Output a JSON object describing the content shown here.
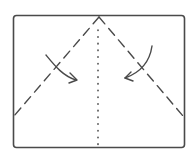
{
  "diagram": {
    "type": "origami-fold-step",
    "colors": {
      "ink": "#4a4a4a",
      "paper": "#ffffff"
    },
    "elements": {
      "paper_outline": "rectangle",
      "left_fold_line": "dashed",
      "right_fold_line": "dashed",
      "center_crease": "dotted",
      "left_arrow": "curved-arrow-right",
      "right_arrow": "curved-arrow-left"
    }
  }
}
